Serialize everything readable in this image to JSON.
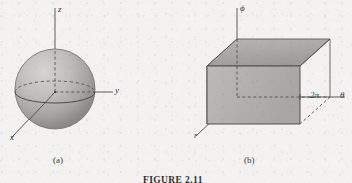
{
  "figure": {
    "caption": "FIGURE 2.11",
    "background_color": "#f3f2f0",
    "ink_color": "#3a3a3a"
  },
  "panels": [
    {
      "id": "a",
      "label": "(a)",
      "kind": "sphere",
      "axes": [
        {
          "name": "z",
          "label": "z",
          "direction": "up"
        },
        {
          "name": "y",
          "label": "y",
          "direction": "right"
        },
        {
          "name": "x",
          "label": "x",
          "direction": "down-left"
        }
      ],
      "surface_fill_light": "#d2d0cd",
      "surface_fill_dark": "#8e8c89"
    },
    {
      "id": "b",
      "label": "(b)",
      "kind": "box",
      "axes": [
        {
          "name": "phi",
          "label": "ϕ",
          "direction": "up"
        },
        {
          "name": "theta",
          "label": "θ",
          "direction": "right"
        },
        {
          "name": "r",
          "label": "r",
          "direction": "down-left"
        }
      ],
      "ticks": [
        {
          "name": "two-pi",
          "label": "2π",
          "axis": "theta"
        }
      ],
      "face_top_fill": "#a9a7a4",
      "face_front_fill": "#b5b3b0",
      "face_left_fill": "#9a9895"
    }
  ]
}
